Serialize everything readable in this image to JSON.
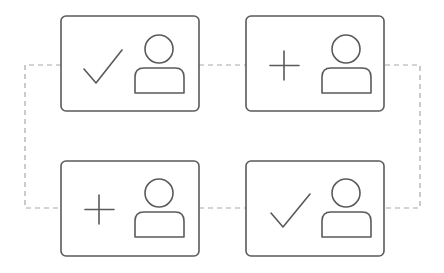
{
  "diagram": {
    "title": "",
    "colors": {
      "card_stroke": "#5a5a5a",
      "icon_stroke": "#5a5a5a",
      "connector": "#a8a8a8",
      "background": "#ffffff"
    },
    "cards": [
      {
        "id": "card-1",
        "position": "top-left",
        "action_icon": "check-icon",
        "user_icon": "person-icon"
      },
      {
        "id": "card-2",
        "position": "top-right",
        "action_icon": "plus-icon",
        "user_icon": "person-icon"
      },
      {
        "id": "card-3",
        "position": "bottom-left",
        "action_icon": "plus-icon",
        "user_icon": "person-icon"
      },
      {
        "id": "card-4",
        "position": "bottom-right",
        "action_icon": "check-icon",
        "user_icon": "person-icon"
      }
    ],
    "connectors": {
      "style": "dashed",
      "links": [
        [
          "card-1",
          "card-2"
        ],
        [
          "card-3",
          "card-4"
        ],
        [
          "card-1",
          "card-3"
        ],
        [
          "card-2",
          "card-4"
        ]
      ]
    }
  }
}
